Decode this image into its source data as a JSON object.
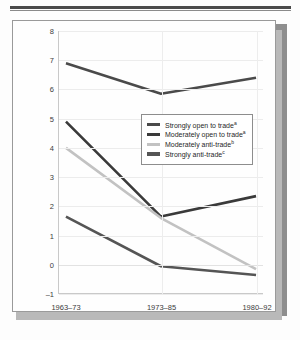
{
  "figure": {
    "card_label": "chart-card"
  },
  "chart_data": {
    "type": "line",
    "title": "",
    "xlabel": "",
    "ylabel": "Average Annual Growth of GDP per Capita",
    "categories": [
      "1963–73",
      "1973–85",
      "1980–92"
    ],
    "ylim": [
      -1,
      8
    ],
    "yticks": [
      -1,
      0,
      1,
      2,
      3,
      4,
      5,
      6,
      7,
      8
    ],
    "ytick_labels": [
      "–1",
      "0",
      "1",
      "2",
      "3",
      "4",
      "5",
      "6",
      "7",
      "8"
    ],
    "grid": true,
    "legend_position": "center",
    "series": [
      {
        "name": "Strongly open to trade",
        "note": "a",
        "color": "#4a4a4a",
        "values": [
          6.9,
          5.85,
          6.4
        ]
      },
      {
        "name": "Moderately open to trade",
        "note": "a",
        "color": "#3a3a3a",
        "values": [
          4.9,
          1.65,
          2.35
        ]
      },
      {
        "name": "Moderately anti-trade",
        "note": "b",
        "color": "#c2c2c2",
        "values": [
          4.0,
          1.6,
          -0.15
        ]
      },
      {
        "name": "Strongly anti-trade",
        "note": "c",
        "color": "#555555",
        "values": [
          1.65,
          -0.05,
          -0.35
        ]
      }
    ]
  }
}
